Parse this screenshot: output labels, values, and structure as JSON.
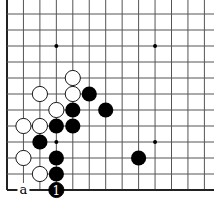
{
  "diagram": {
    "type": "go-board-fragment",
    "visible_columns": 13,
    "visible_rows": 12,
    "edges": [
      "left",
      "bottom"
    ],
    "colors": {
      "line": "#555555",
      "edge": "#222222",
      "black": "#000000",
      "white": "#ffffff",
      "background": "#ffffff"
    },
    "star_points": [
      [
        3,
        2
      ],
      [
        9,
        2
      ],
      [
        3,
        8
      ],
      [
        9,
        8
      ]
    ],
    "white_stones": [
      [
        4,
        4
      ],
      [
        2,
        5
      ],
      [
        4,
        5
      ],
      [
        3,
        6
      ],
      [
        1,
        7
      ],
      [
        2,
        7
      ],
      [
        1,
        9
      ],
      [
        2,
        10
      ]
    ],
    "black_stones": [
      [
        5,
        5
      ],
      [
        4,
        6
      ],
      [
        6,
        6
      ],
      [
        3,
        7
      ],
      [
        4,
        7
      ],
      [
        2,
        8
      ],
      [
        3,
        9
      ],
      [
        3,
        10
      ],
      [
        8,
        9
      ]
    ],
    "numbered_moves": [
      {
        "col": 3,
        "row": 11,
        "color": "black",
        "label": "1"
      }
    ],
    "point_labels": [
      {
        "col": 1,
        "row": 11,
        "label": "a"
      }
    ]
  }
}
